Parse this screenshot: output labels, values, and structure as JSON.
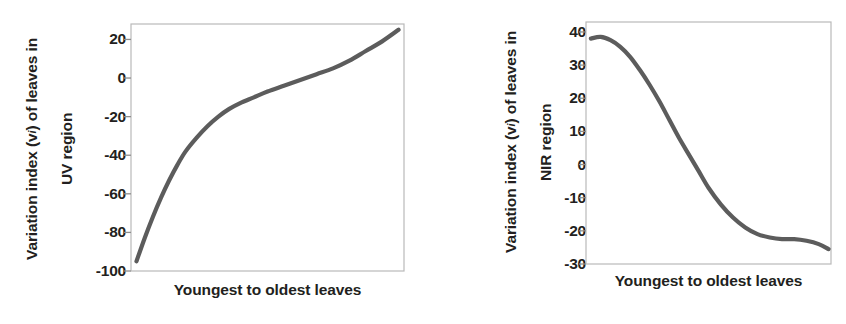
{
  "figure": {
    "background": "#ffffff",
    "curve_color": "#5c5c5c",
    "frame_color": "#b9b9b9",
    "text_color": "#231f20"
  },
  "panels": [
    {
      "id": "uv",
      "ylabel_line1": "Variation index (v",
      "ylabel_sub": "i",
      "ylabel_line1_end": ") of leaves in",
      "ylabel_line2": "UV region",
      "ylabel_full": "Variation index (vi) of leaves in UV region",
      "xlabel": "Youngest to oldest leaves",
      "yticks": [
        "20",
        "0",
        "-20",
        "-40",
        "-60",
        "-80",
        "-100"
      ]
    },
    {
      "id": "nir",
      "ylabel_line1": "Variation index (v",
      "ylabel_sub": "i",
      "ylabel_line1_end": ") of leaves in",
      "ylabel_line2": "NIR region",
      "ylabel_full": "Variation index (vi) of leaves in NIR region",
      "xlabel": "Youngest to oldest leaves",
      "yticks": [
        "40",
        "30",
        "20",
        "10",
        "0",
        "-10",
        "-20",
        "-30"
      ]
    }
  ],
  "chart_data": [
    {
      "type": "line",
      "title": "",
      "subtitle": "",
      "xlabel": "Youngest to oldest leaves",
      "ylabel": "Variation index (vi) of leaves in UV region",
      "legend": [],
      "legend_position": "none",
      "grid": false,
      "xlim": [
        0,
        100
      ],
      "ylim": [
        -100,
        28
      ],
      "yticks": [
        20,
        0,
        -20,
        -40,
        -60,
        -80,
        -100
      ],
      "xticks": [],
      "x": [
        2,
        5,
        8,
        11,
        14,
        17,
        20,
        24,
        28,
        32,
        36,
        40,
        45,
        50,
        56,
        62,
        68,
        74,
        80,
        86,
        92,
        98
      ],
      "series": [
        {
          "name": "Variation index in UV region",
          "values": [
            -95,
            -83,
            -72,
            -62,
            -53,
            -45,
            -38,
            -31,
            -25,
            -20,
            -16,
            -13,
            -10,
            -7,
            -4,
            -1,
            2,
            5,
            9,
            14,
            19,
            25
          ]
        }
      ]
    },
    {
      "type": "line",
      "title": "",
      "subtitle": "",
      "xlabel": "Youngest to oldest leaves",
      "ylabel": "Variation index (vi) of leaves in NIR region",
      "legend": [],
      "legend_position": "none",
      "grid": false,
      "xlim": [
        0,
        100
      ],
      "ylim": [
        -30,
        43
      ],
      "yticks": [
        40,
        30,
        20,
        10,
        0,
        -10,
        -20,
        -30
      ],
      "xticks": [],
      "x": [
        2,
        6,
        10,
        14,
        18,
        22,
        26,
        30,
        34,
        38,
        42,
        46,
        50,
        55,
        60,
        65,
        70,
        75,
        80,
        85,
        90,
        95,
        99
      ],
      "series": [
        {
          "name": "Variation index in NIR region",
          "values": [
            38,
            38.5,
            37.5,
            35.5,
            32.5,
            28.5,
            24,
            19,
            13.5,
            8,
            3,
            -2,
            -7,
            -12,
            -16,
            -19,
            -21,
            -22,
            -22.5,
            -22.5,
            -23,
            -24,
            -25.5
          ]
        }
      ]
    }
  ]
}
